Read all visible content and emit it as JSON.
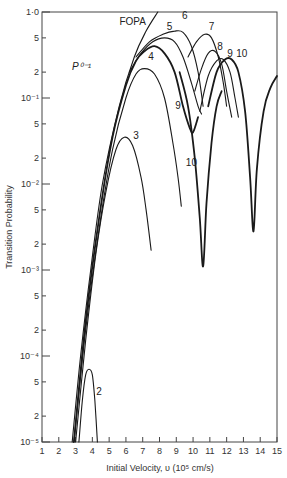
{
  "chart_data": {
    "type": "line",
    "title": "",
    "xlabel": "Initial Velocity, υ (10⁵ cm/s)",
    "ylabel": "Transition Probability",
    "annotation": "P⁰⁻¹",
    "xlim": [
      1,
      15
    ],
    "ylim": [
      1e-05,
      1.0
    ],
    "yscale": "log",
    "grid": false,
    "legend": "none (curves labeled inline)",
    "x_ticks": [
      "1",
      "2",
      "3",
      "4",
      "5",
      "6",
      "7",
      "8",
      "9",
      "10",
      "11",
      "12",
      "13",
      "14",
      "15"
    ],
    "y_ticks": [
      {
        "value": 1.0,
        "label": "1·0"
      },
      {
        "value": 0.5,
        "label": "5"
      },
      {
        "value": 0.2,
        "label": "2"
      },
      {
        "value": 0.1,
        "label": "10⁻¹"
      },
      {
        "value": 0.05,
        "label": "5"
      },
      {
        "value": 0.02,
        "label": "2"
      },
      {
        "value": 0.01,
        "label": "10⁻²"
      },
      {
        "value": 0.005,
        "label": "5"
      },
      {
        "value": 0.002,
        "label": "2"
      },
      {
        "value": 0.001,
        "label": "10⁻³"
      },
      {
        "value": 0.0005,
        "label": "5"
      },
      {
        "value": 0.0002,
        "label": "2"
      },
      {
        "value": 0.0001,
        "label": "10⁻⁴"
      },
      {
        "value": 5e-05,
        "label": "5"
      },
      {
        "value": 2e-05,
        "label": "2"
      },
      {
        "value": 1e-05,
        "label": "10⁻⁵"
      }
    ],
    "series": [
      {
        "name": "FOPA",
        "label_at": [
          6.4,
          0.7
        ],
        "weight": "thin",
        "points": [
          [
            2.8,
            1e-05
          ],
          [
            3.3,
            0.0001
          ],
          [
            3.9,
            0.001
          ],
          [
            4.6,
            0.01
          ],
          [
            5.6,
            0.08
          ],
          [
            6.5,
            0.3
          ],
          [
            7.2,
            0.6
          ],
          [
            7.9,
            1.0
          ]
        ]
      },
      {
        "name": "2",
        "label_at": [
          4.4,
          3.5e-05
        ],
        "weight": "thin",
        "points": [
          [
            3.2,
            1e-05
          ],
          [
            3.4,
            3e-05
          ],
          [
            3.6,
            6e-05
          ],
          [
            3.8,
            7e-05
          ],
          [
            4.0,
            6e-05
          ],
          [
            4.15,
            3e-05
          ],
          [
            4.3,
            1e-05
          ]
        ]
      },
      {
        "name": "3",
        "label_at": [
          6.6,
          0.033
        ],
        "weight": "thin",
        "points": [
          [
            3.0,
            1e-05
          ],
          [
            3.6,
            0.00015
          ],
          [
            4.2,
            0.0015
          ],
          [
            4.8,
            0.008
          ],
          [
            5.4,
            0.025
          ],
          [
            5.9,
            0.035
          ],
          [
            6.4,
            0.028
          ],
          [
            6.9,
            0.012
          ],
          [
            7.2,
            0.005
          ],
          [
            7.5,
            0.0017
          ]
        ]
      },
      {
        "name": "4",
        "label_at": [
          7.5,
          0.28
        ],
        "weight": "thin",
        "points": [
          [
            2.9,
            1e-05
          ],
          [
            3.6,
            0.0002
          ],
          [
            4.4,
            0.003
          ],
          [
            5.2,
            0.025
          ],
          [
            6.0,
            0.1
          ],
          [
            6.6,
            0.19
          ],
          [
            7.1,
            0.22
          ],
          [
            7.7,
            0.19
          ],
          [
            8.3,
            0.1
          ],
          [
            8.8,
            0.03
          ],
          [
            9.1,
            0.012
          ],
          [
            9.3,
            0.0055
          ]
        ]
      },
      {
        "name": "5",
        "label_at": [
          8.6,
          0.62
        ],
        "weight": "thin",
        "points": [
          [
            6.2,
            0.2
          ],
          [
            6.9,
            0.33
          ],
          [
            7.6,
            0.45
          ],
          [
            8.3,
            0.5
          ],
          [
            8.9,
            0.45
          ],
          [
            9.4,
            0.3
          ],
          [
            9.9,
            0.15
          ],
          [
            10.3,
            0.08
          ],
          [
            10.5,
            0.065
          ]
        ]
      },
      {
        "name": "6",
        "label_at": [
          9.5,
          0.82
        ],
        "weight": "thin",
        "points": [
          [
            6.6,
            0.3
          ],
          [
            7.4,
            0.45
          ],
          [
            8.2,
            0.55
          ],
          [
            8.9,
            0.6
          ],
          [
            9.4,
            0.58
          ],
          [
            9.9,
            0.4
          ],
          [
            10.3,
            0.2
          ],
          [
            10.6,
            0.08
          ]
        ]
      },
      {
        "name": "7",
        "label_at": [
          11.1,
          0.62
        ],
        "weight": "thin",
        "points": [
          [
            9.7,
            0.3
          ],
          [
            10.2,
            0.45
          ],
          [
            10.7,
            0.55
          ],
          [
            11.1,
            0.5
          ],
          [
            11.5,
            0.3
          ],
          [
            11.8,
            0.15
          ],
          [
            12.0,
            0.08
          ]
        ]
      },
      {
        "name": "8",
        "label_at": [
          11.6,
          0.36
        ],
        "weight": "thin",
        "points": [
          [
            10.1,
            0.12
          ],
          [
            10.5,
            0.22
          ],
          [
            10.9,
            0.33
          ],
          [
            11.3,
            0.35
          ],
          [
            11.7,
            0.25
          ],
          [
            12.0,
            0.12
          ],
          [
            12.3,
            0.06
          ]
        ]
      },
      {
        "name": "9 (upper)",
        "label_at": [
          12.2,
          0.3
        ],
        "weight": "thin",
        "points": [
          [
            10.4,
            0.07
          ],
          [
            10.9,
            0.18
          ],
          [
            11.4,
            0.27
          ],
          [
            11.8,
            0.28
          ],
          [
            12.2,
            0.2
          ],
          [
            12.5,
            0.1
          ],
          [
            12.7,
            0.06
          ]
        ]
      },
      {
        "name": "10 (upper)",
        "label_at": [
          12.9,
          0.3
        ],
        "weight": "thick",
        "points": [
          [
            10.9,
            0.08
          ],
          [
            11.4,
            0.2
          ],
          [
            11.9,
            0.28
          ],
          [
            12.3,
            0.28
          ],
          [
            12.7,
            0.2
          ],
          [
            13.1,
            0.07
          ],
          [
            13.4,
            0.012
          ],
          [
            13.6,
            0.0028
          ],
          [
            13.8,
            0.015
          ],
          [
            14.2,
            0.07
          ],
          [
            14.6,
            0.13
          ],
          [
            15.0,
            0.18
          ]
        ]
      },
      {
        "name": "9 (lower)",
        "label_at": [
          9.1,
          0.075
        ],
        "weight": "thick",
        "points": [
          [
            2.9,
            1e-05
          ],
          [
            3.6,
            0.00025
          ],
          [
            4.4,
            0.004
          ],
          [
            5.2,
            0.035
          ],
          [
            6.0,
            0.14
          ],
          [
            6.6,
            0.27
          ],
          [
            7.1,
            0.35
          ],
          [
            7.7,
            0.4
          ],
          [
            8.3,
            0.33
          ],
          [
            8.9,
            0.2
          ],
          [
            9.4,
            0.08
          ],
          [
            9.8,
            0.045
          ],
          [
            10.0,
            0.04
          ],
          [
            10.3,
            0.06
          ]
        ]
      },
      {
        "name": "10 (lower)",
        "label_at": [
          9.9,
          0.016
        ],
        "weight": "thick",
        "points": [
          [
            9.2,
            0.2
          ],
          [
            9.7,
            0.08
          ],
          [
            10.1,
            0.02
          ],
          [
            10.4,
            0.004
          ],
          [
            10.6,
            0.0011
          ],
          [
            10.8,
            0.006
          ],
          [
            11.1,
            0.03
          ],
          [
            11.4,
            0.08
          ],
          [
            11.7,
            0.12
          ]
        ]
      }
    ]
  }
}
